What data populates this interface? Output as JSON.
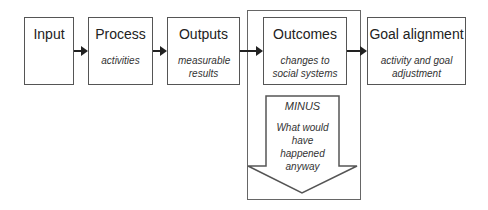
{
  "boxes": [
    {
      "title": "Input",
      "subtitle": ""
    },
    {
      "title": "Process",
      "subtitle": "activities"
    },
    {
      "title": "Outputs",
      "subtitle": "measurable results"
    },
    {
      "title": "Outcomes",
      "subtitle": "changes to social systems"
    },
    {
      "title": "Goal alignment",
      "subtitle": "activity and goal adjustment"
    }
  ],
  "minus_arrow": {
    "label": "MINUS",
    "text": "What would have happened anyway"
  },
  "colors": {
    "stroke": "#555555",
    "text": "#222222"
  }
}
